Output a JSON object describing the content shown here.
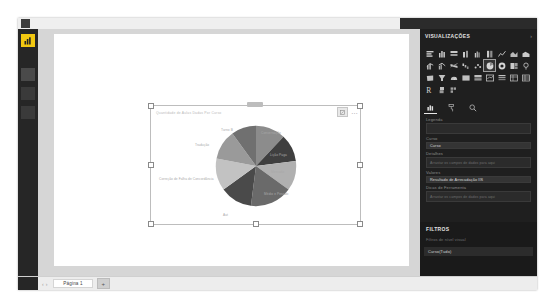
{
  "window": {
    "app_name": "Power BI Desktop"
  },
  "nav_rail": {
    "logo_icon": "powerbi-logo-icon",
    "items": [
      {
        "name": "report-view",
        "icon": "report-icon"
      },
      {
        "name": "data-view",
        "icon": "table-icon"
      },
      {
        "name": "model-view",
        "icon": "model-icon"
      }
    ]
  },
  "visual": {
    "title": "Quantidade de Aulas Dadas Por Curso",
    "focus_icon": "focus-mode-icon",
    "more_options": "…",
    "header_more_icon": "more-options-icon"
  },
  "chart_data": {
    "type": "pie",
    "title": "Quantidade de Aulas Dadas Por Curso",
    "categories": [
      "Conversação",
      "Lição Paga",
      "Mercado",
      "Médio e Pesado",
      "Aut",
      "Correção de Falha de Concordância",
      "Tradução",
      "Turno B"
    ],
    "values": [
      12,
      11,
      12,
      17,
      13,
      13,
      12,
      10
    ],
    "colors": [
      "#8c8c8c",
      "#3f3f3f",
      "#b0b0b0",
      "#6a6a6a",
      "#4a4a4a",
      "#c2c2c2",
      "#9a9a9a",
      "#707070"
    ],
    "legend": "none",
    "data_labels": false
  },
  "viz_pane": {
    "header": "VISUALIZAÇÕES",
    "collapse_icon": "chevron-right-icon",
    "icons": [
      "stacked-bar-chart-icon",
      "clustered-bar-chart-icon",
      "100-stacked-bar-icon",
      "stacked-column-icon",
      "clustered-column-icon",
      "100-stacked-column-icon",
      "line-chart-icon",
      "area-chart-icon",
      "stacked-area-icon",
      "line-stacked-column-icon",
      "line-clustered-column-icon",
      "ribbon-chart-icon",
      "waterfall-chart-icon",
      "scatter-chart-icon",
      "pie-chart-icon",
      "donut-chart-icon",
      "treemap-icon",
      "map-icon",
      "filled-map-icon",
      "funnel-icon",
      "gauge-icon",
      "card-icon",
      "multi-row-card-icon",
      "kpi-icon",
      "slicer-icon",
      "table-icon",
      "matrix-icon",
      "r-script-visual-icon",
      "python-visual-icon",
      "get-more-visuals-icon"
    ],
    "selected_icon": "pie-chart-icon",
    "pane_tabs": [
      {
        "name": "fields-tab",
        "icon": "fields-icon",
        "active": true
      },
      {
        "name": "format-tab",
        "icon": "paint-roller-icon",
        "active": false
      },
      {
        "name": "analytics-tab",
        "icon": "magnifier-icon",
        "active": false
      }
    ],
    "wells": [
      {
        "label": "Legenda",
        "value": "",
        "placeholder": ""
      },
      {
        "label": "Curso",
        "value": "Curso",
        "placeholder": ""
      },
      {
        "label": "Detalhes",
        "value": "",
        "placeholder": "Arrastar os campos de dados para aqui"
      },
      {
        "label": "Valores",
        "value": "Resultado de Arrecadação IÍS",
        "placeholder": ""
      },
      {
        "label": "Dicas de Ferramenta",
        "value": "",
        "placeholder": "Arrastar os campos de dados para aqui"
      }
    ]
  },
  "filters": {
    "header": "FILTROS",
    "level_label": "Filtros de nível visual",
    "items": [
      {
        "label": "Curso(Tudo)"
      }
    ]
  },
  "page_bar": {
    "prev_icon": "‹",
    "next_icon": "›",
    "tabs": [
      {
        "label": "Página 1",
        "active": true
      }
    ],
    "add_label": "+"
  }
}
